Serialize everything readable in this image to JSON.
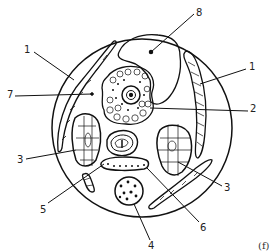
{
  "figure": {
    "panel_label": "(f)",
    "labels": [
      {
        "id": "label-1a",
        "text": "1",
        "x": 24,
        "y": 49
      },
      {
        "id": "label-1b",
        "text": "1",
        "x": 249,
        "y": 65
      },
      {
        "id": "label-2",
        "text": "2",
        "x": 250,
        "y": 106
      },
      {
        "id": "label-7",
        "text": "7",
        "x": 8,
        "y": 90
      },
      {
        "id": "label-8",
        "text": "8",
        "x": 197,
        "y": 10
      },
      {
        "id": "label-3a",
        "text": "3",
        "x": 17,
        "y": 157
      },
      {
        "id": "label-3b",
        "text": "3",
        "x": 224,
        "y": 182
      },
      {
        "id": "label-5",
        "text": "5",
        "x": 40,
        "y": 206
      },
      {
        "id": "label-6",
        "text": "6",
        "x": 200,
        "y": 225
      },
      {
        "id": "label-4",
        "text": "4",
        "x": 150,
        "y": 241
      }
    ]
  }
}
